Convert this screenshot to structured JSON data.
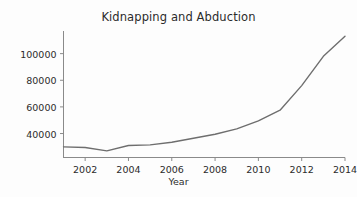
{
  "chart_data": {
    "type": "line",
    "title": "Kidnapping and Abduction",
    "xlabel": "Year",
    "ylabel": "",
    "x": [
      2001,
      2002,
      2003,
      2004,
      2005,
      2006,
      2007,
      2008,
      2009,
      2010,
      2011,
      2012,
      2013,
      2014
    ],
    "values": [
      30000,
      29500,
      27000,
      31000,
      31500,
      33500,
      36500,
      39500,
      43500,
      49500,
      57500,
      76000,
      98000,
      113000
    ],
    "series": [
      {
        "name": "Kidnapping and Abduction",
        "values": [
          30000,
          29500,
          27000,
          31000,
          31500,
          33500,
          36500,
          39500,
          43500,
          49500,
          57500,
          76000,
          98000,
          113000
        ]
      }
    ],
    "xlim": [
      2001,
      2014
    ],
    "ylim": [
      22000,
      117000
    ],
    "xticks": [
      2002,
      2004,
      2006,
      2008,
      2010,
      2012,
      2014
    ],
    "xtick_labels": [
      "2002",
      "2004",
      "2006",
      "2008",
      "2010",
      "2012",
      "2014"
    ],
    "yticks": [
      40000,
      60000,
      80000,
      100000
    ],
    "ytick_labels": [
      "40000",
      "60000",
      "80000",
      "100000"
    ],
    "grid": false,
    "legend": false,
    "line_color": "#6e6e6e",
    "background_color": "#fdfdfd",
    "axis_color": "#8a8a8a",
    "text_color": "#2b2b2b"
  }
}
